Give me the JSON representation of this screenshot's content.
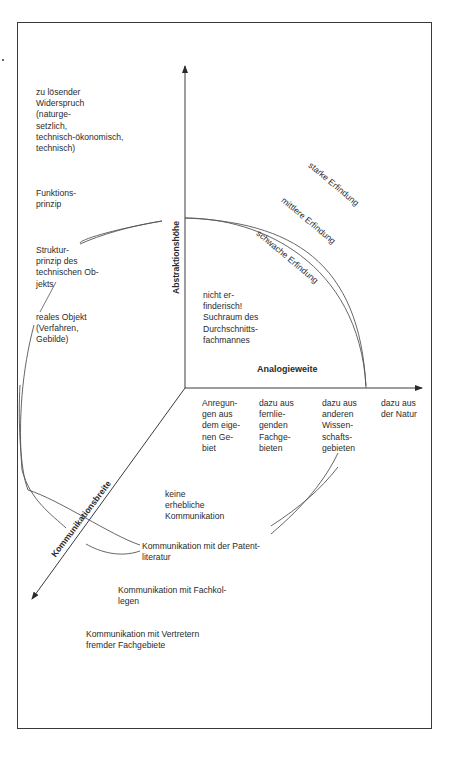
{
  "figure": {
    "axes": {
      "vertical": "Abstraktionshöhe",
      "horizontal": "Analogieweite",
      "diagonal": "Kommunikationsbreite"
    },
    "abstraction_levels": [
      "zu lösender\nWiderspruch\n(naturge-\nsetzlich,\ntechnisch-ökonomisch,\ntechnisch)",
      "Funktions-\nprinzip",
      "Struktur-\nprinzip des\ntechnischen Ob-\njekts",
      "reales Objekt\n(Verfahren,\nGebilde)"
    ],
    "analogy_levels": [
      "Anregun-\ngen aus\ndem eige-\nnen Ge-\nbiet",
      "dazu aus\nfernlie-\ngenden\nFachge-\nbieten",
      "dazu aus\nanderen\nWissen-\nschafts-\ngebieten",
      "dazu aus\nder Natur"
    ],
    "communication_levels": [
      "keine\nerhebliche\nKommunikation",
      "Kommunikation mit der Patent-\nliteratur",
      "Kommunikation mit Fachkol-\nlegen",
      "Kommunikation mit Vertretern\nfremder Fachgebiete"
    ],
    "invention_grades": [
      "schwache Erfindung",
      "mittlere Erfindung",
      "starke Erfindung"
    ],
    "center_region": "nicht er-\nfinderisch!\nSuchraum des\nDurchschnitts-\nfachmannes"
  },
  "colors": {
    "line": "#3a3a3a",
    "text": "#2b2b2b",
    "background": "#ffffff"
  }
}
